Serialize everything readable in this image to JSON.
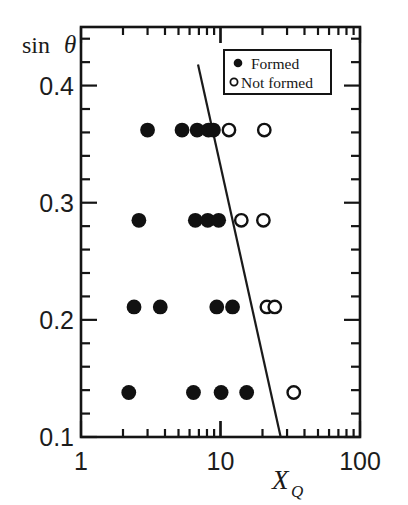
{
  "chart_data": {
    "type": "scatter",
    "title": "",
    "xlabel": "X_Q",
    "xlabel_base": "X",
    "xlabel_sub": "Q",
    "ylabel": "sin θ",
    "ylabel_fn": "sin",
    "ylabel_sym": "θ",
    "xscale": "log",
    "yscale": "linear",
    "xlim": [
      1,
      100
    ],
    "ylim": [
      0.1,
      0.45
    ],
    "grid": false,
    "xticks": [
      1,
      10,
      100
    ],
    "xtick_labels": [
      "1",
      "10",
      "100"
    ],
    "yticks": [
      0.1,
      0.2,
      0.3,
      0.4
    ],
    "ytick_labels": [
      "0.1",
      "0.2",
      "0.3",
      "0.4"
    ],
    "yminor_step": 0.02,
    "legend_position": "top-right",
    "series": [
      {
        "name": "Formed",
        "marker": "filled-circle",
        "color": "#111111",
        "points": [
          {
            "x": 3.0,
            "y": 0.362
          },
          {
            "x": 5.3,
            "y": 0.362
          },
          {
            "x": 6.8,
            "y": 0.362
          },
          {
            "x": 8.2,
            "y": 0.362
          },
          {
            "x": 8.9,
            "y": 0.362
          },
          {
            "x": 2.6,
            "y": 0.285
          },
          {
            "x": 6.6,
            "y": 0.285
          },
          {
            "x": 8.1,
            "y": 0.285
          },
          {
            "x": 9.7,
            "y": 0.285
          },
          {
            "x": 2.4,
            "y": 0.211
          },
          {
            "x": 3.7,
            "y": 0.211
          },
          {
            "x": 9.4,
            "y": 0.211
          },
          {
            "x": 12.2,
            "y": 0.211
          },
          {
            "x": 2.2,
            "y": 0.138
          },
          {
            "x": 6.4,
            "y": 0.138
          },
          {
            "x": 10.1,
            "y": 0.138
          },
          {
            "x": 15.4,
            "y": 0.138
          }
        ]
      },
      {
        "name": "Not formed",
        "marker": "open-circle",
        "color": "#111111",
        "points": [
          {
            "x": 11.5,
            "y": 0.362
          },
          {
            "x": 20.6,
            "y": 0.362
          },
          {
            "x": 14.1,
            "y": 0.285
          },
          {
            "x": 20.3,
            "y": 0.285
          },
          {
            "x": 21.5,
            "y": 0.211
          },
          {
            "x": 24.5,
            "y": 0.211
          },
          {
            "x": 33.5,
            "y": 0.138
          }
        ]
      }
    ],
    "boundary_line": {
      "name": "boundary",
      "x_start": 6.9,
      "y_start": 0.418,
      "x_end": 27.0,
      "y_end": 0.1,
      "color": "#1a1a1a"
    },
    "legend": {
      "entries": [
        {
          "label": "Formed",
          "marker": "filled-circle"
        },
        {
          "label": "Not formed",
          "marker": "open-circle"
        }
      ]
    }
  },
  "axes": {
    "y_axis_title": "sin θ",
    "x_axis_title": "XQ"
  }
}
